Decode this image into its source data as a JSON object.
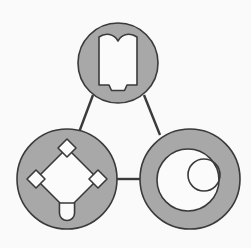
{
  "diagram": {
    "type": "node-link-triangle",
    "background_color": "#fafafa",
    "node_fill_color": "#a8a8a8",
    "node_stroke_color": "#3a3a3a",
    "glyph_fill_color": "#fbfbfb",
    "glyph_stroke_color": "#3a3a3a",
    "connector_color": "#3a3a3a",
    "node_count": 3,
    "connector_count": 3,
    "nodes": [
      {
        "id": "node-top",
        "name": "book-node",
        "glyph": "open-book-icon",
        "glyph_label": "Open Book",
        "position": "top",
        "cx": 118,
        "cy": 63,
        "r": 40,
        "fill": "#a8a8a8",
        "stroke": "#3a3a3a",
        "stroke_width": 1.6
      },
      {
        "id": "node-bottom-left",
        "name": "diamond-node",
        "glyph": "diamond-network-icon",
        "glyph_label": "Diamond Network",
        "position": "bottom-left",
        "cx": 67,
        "cy": 179,
        "r": 50,
        "fill": "#a8a8a8",
        "stroke": "#3a3a3a",
        "stroke_width": 1.6
      },
      {
        "id": "node-bottom-right",
        "name": "ring-node",
        "glyph": "circles-icon",
        "glyph_label": "Concentric Circles",
        "position": "bottom-right",
        "cx": 190,
        "cy": 179,
        "r": 50,
        "fill": "#a8a8a8",
        "stroke": "#3a3a3a",
        "stroke_width": 1.6
      }
    ],
    "connectors": [
      {
        "id": "edge-top-left",
        "name": "connector-top-to-bottom-left",
        "from": "node-top",
        "to": "node-bottom-left",
        "x1": 93,
        "y1": 95,
        "x2": 78,
        "y2": 135,
        "stroke": "#3a3a3a",
        "stroke_width": 2.4
      },
      {
        "id": "edge-top-right",
        "name": "connector-top-to-bottom-right",
        "from": "node-top",
        "to": "node-bottom-right",
        "x1": 144,
        "y1": 95,
        "x2": 160,
        "y2": 135,
        "stroke": "#3a3a3a",
        "stroke_width": 2.4
      },
      {
        "id": "edge-left-right",
        "name": "connector-bottom-left-to-bottom-right",
        "from": "node-bottom-left",
        "to": "node-bottom-right",
        "x1": 115,
        "y1": 179,
        "x2": 142,
        "y2": 179,
        "stroke": "#3a3a3a",
        "stroke_width": 2.4
      }
    ],
    "glyphs": {
      "open_book": {
        "name": "open-book-icon",
        "path": "M 99 37 C 107 33 115 35 118 41 C 121 35 129 33 137 37 L 137 85 L 126 85 L 126 90 L 110 90 L 110 85 L 99 85 Z",
        "fill": "#fbfbfb",
        "stroke": "#3a3a3a",
        "stroke_width": 1.6
      },
      "diamond_network": {
        "name": "diamond-network-icon",
        "outer_diamond": {
          "points": "67,148 98,179 67,210 36,179",
          "fill": "#fbfbfb",
          "stroke": "#3a3a3a",
          "stroke_width": 1.6
        },
        "vertex_nodes": [
          {
            "name": "vertex-top",
            "shape": "diamond",
            "cx": 67,
            "cy": 148,
            "size": 9
          },
          {
            "name": "vertex-left",
            "shape": "diamond",
            "cx": 36,
            "cy": 179,
            "size": 9
          },
          {
            "name": "vertex-right",
            "shape": "diamond",
            "cx": 98,
            "cy": 179,
            "size": 9
          },
          {
            "name": "vertex-bottom",
            "shape": "rounded-pin",
            "cx": 67,
            "cy": 210,
            "size": 9
          }
        ]
      },
      "circles": {
        "name": "circles-icon",
        "inner_disc": {
          "name": "large-inner-circle",
          "cx": 188,
          "cy": 180,
          "r": 31,
          "fill": "#fbfbfb",
          "stroke": "#3a3a3a",
          "stroke_width": 1.6
        },
        "small_circle": {
          "name": "small-offset-circle",
          "cx": 204,
          "cy": 175,
          "r": 16,
          "fill": "none",
          "stroke": "#3a3a3a",
          "stroke_width": 1.6
        }
      }
    }
  }
}
